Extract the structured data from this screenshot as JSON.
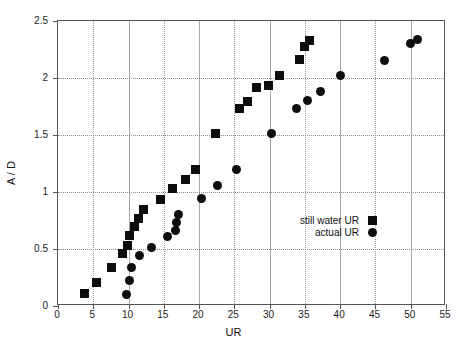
{
  "chart_data": {
    "type": "scatter",
    "title": "",
    "xlabel": "UR",
    "ylabel": "A / D",
    "xlim": [
      0,
      55
    ],
    "ylim": [
      0,
      2.5
    ],
    "xticks": [
      0,
      5,
      10,
      15,
      20,
      25,
      30,
      35,
      40,
      45,
      50,
      55
    ],
    "yticks": [
      0,
      0.5,
      1,
      1.5,
      2,
      2.5
    ],
    "xtick_labels": [
      "0",
      "5",
      "10",
      "15",
      "20",
      "25",
      "30",
      "35",
      "40",
      "45",
      "50",
      "55"
    ],
    "ytick_labels": [
      "0",
      "0.5",
      "1",
      "1.5",
      "2",
      "2.5"
    ],
    "grid": true,
    "legend_position": "center-right",
    "marker_color": "#0d0d0d",
    "series": [
      {
        "name": "still water UR",
        "marker": "square",
        "points": [
          [
            3.7,
            0.11
          ],
          [
            5.4,
            0.21
          ],
          [
            7.6,
            0.34
          ],
          [
            9.2,
            0.46
          ],
          [
            9.9,
            0.53
          ],
          [
            10.1,
            0.62
          ],
          [
            10.9,
            0.7
          ],
          [
            11.4,
            0.77
          ],
          [
            12.1,
            0.85
          ],
          [
            14.6,
            0.93
          ],
          [
            16.2,
            1.03
          ],
          [
            18.1,
            1.11
          ],
          [
            19.5,
            1.2
          ],
          [
            22.3,
            1.51
          ],
          [
            25.7,
            1.73
          ],
          [
            26.9,
            1.79
          ],
          [
            28.1,
            1.92
          ],
          [
            29.8,
            1.93
          ],
          [
            31.4,
            2.02
          ],
          [
            34.2,
            2.16
          ],
          [
            34.9,
            2.28
          ],
          [
            35.6,
            2.33
          ]
        ]
      },
      {
        "name": "actual UR",
        "marker": "circle",
        "points": [
          [
            9.7,
            0.1
          ],
          [
            10.1,
            0.22
          ],
          [
            10.4,
            0.34
          ],
          [
            11.5,
            0.44
          ],
          [
            13.3,
            0.51
          ],
          [
            15.5,
            0.61
          ],
          [
            16.6,
            0.66
          ],
          [
            16.8,
            0.73
          ],
          [
            17.1,
            0.8
          ],
          [
            20.4,
            0.94
          ],
          [
            22.6,
            1.06
          ],
          [
            25.3,
            1.2
          ],
          [
            30.3,
            1.51
          ],
          [
            33.8,
            1.73
          ],
          [
            35.3,
            1.8
          ],
          [
            37.2,
            1.88
          ],
          [
            40.0,
            2.02
          ],
          [
            46.3,
            2.15
          ],
          [
            49.9,
            2.3
          ],
          [
            51.0,
            2.34
          ]
        ]
      }
    ]
  },
  "legend": {
    "items": [
      {
        "label": "still water UR",
        "marker": "square"
      },
      {
        "label": "actual UR",
        "marker": "circle"
      }
    ]
  }
}
